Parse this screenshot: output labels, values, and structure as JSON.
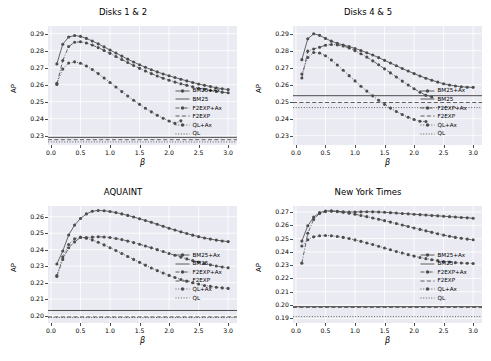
{
  "figure": {
    "width": 491,
    "height": 361,
    "background": "#ffffff",
    "panel_background": "#eaeaf2",
    "grid_color": "#ffffff",
    "series_color": "#4c4c4c",
    "text_color": "#000000"
  },
  "axis_labels": {
    "y": "AP",
    "x": "β"
  },
  "legend_entries": [
    {
      "label": "BM25+Ax",
      "style": "solid-marker"
    },
    {
      "label": "BM25",
      "style": "solid"
    },
    {
      "label": "F2EXP+Ax",
      "style": "dashdot-marker"
    },
    {
      "label": "F2EXP",
      "style": "dashed"
    },
    {
      "label": "QL+Ax",
      "style": "dotted-marker"
    },
    {
      "label": "QL",
      "style": "dotted"
    }
  ],
  "chart_data": [
    {
      "type": "line",
      "title": "Disks 1 & 2",
      "xlabel": "β",
      "ylabel": "AP",
      "xlim": [
        -0.05,
        3.15
      ],
      "ylim": [
        0.2245,
        0.2945
      ],
      "xticks": [
        "0.0",
        "0.5",
        "1.0",
        "1.5",
        "2.0",
        "2.5",
        "3.0"
      ],
      "xtick_values": [
        0.0,
        0.5,
        1.0,
        1.5,
        2.0,
        2.5,
        3.0
      ],
      "yticks": [
        "0.23",
        "0.24",
        "0.25",
        "0.26",
        "0.27",
        "0.28",
        "0.29"
      ],
      "ytick_values": [
        0.23,
        0.24,
        0.25,
        0.26,
        0.27,
        0.28,
        0.29
      ],
      "grid": true,
      "legend_position": "lower right",
      "x": [
        0.1,
        0.2,
        0.3,
        0.4,
        0.5,
        0.6,
        0.7,
        0.8,
        0.9,
        1.0,
        1.1,
        1.2,
        1.3,
        1.4,
        1.5,
        1.6,
        1.7,
        1.8,
        1.9,
        2.0,
        2.1,
        2.2,
        2.3,
        2.4,
        2.5,
        2.6,
        2.7,
        2.8,
        2.9,
        3.0
      ],
      "series": [
        {
          "name": "BM25+Ax",
          "values": [
            0.2722,
            0.2838,
            0.288,
            0.2889,
            0.2884,
            0.2872,
            0.2857,
            0.284,
            0.2822,
            0.2804,
            0.2786,
            0.2768,
            0.275,
            0.2733,
            0.2717,
            0.2702,
            0.2688,
            0.2675,
            0.2663,
            0.2652,
            0.2642,
            0.2632,
            0.2622,
            0.2613,
            0.2604,
            0.2596,
            0.2589,
            0.2582,
            0.2576,
            0.2571
          ]
        },
        {
          "name": "F2EXP+Ax",
          "values": [
            0.2601,
            0.2742,
            0.2824,
            0.2849,
            0.2852,
            0.2845,
            0.2833,
            0.2818,
            0.2801,
            0.2784,
            0.2766,
            0.2748,
            0.273,
            0.2713,
            0.2696,
            0.268,
            0.2665,
            0.2651,
            0.2638,
            0.2626,
            0.2615,
            0.2605,
            0.2596,
            0.2587,
            0.2579,
            0.2572,
            0.2566,
            0.256,
            0.2556,
            0.2552
          ]
        },
        {
          "name": "QL+Ax",
          "values": [
            0.2608,
            0.2692,
            0.2727,
            0.2734,
            0.2726,
            0.271,
            0.2689,
            0.2665,
            0.2639,
            0.2613,
            0.2586,
            0.2559,
            0.2533,
            0.2508,
            0.2484,
            0.2461,
            0.244,
            0.242,
            0.2402,
            0.2386,
            0.2372,
            0.2387,
            null,
            null,
            null,
            null,
            null,
            null,
            null,
            null
          ]
        }
      ],
      "hlines": [
        {
          "name": "BM25",
          "value": 0.229,
          "style": "solid"
        },
        {
          "name": "F2EXP",
          "value": 0.2276,
          "style": "dashed"
        },
        {
          "name": "QL",
          "value": 0.2263,
          "style": "dotted"
        }
      ]
    },
    {
      "type": "line",
      "title": "Disks 4 & 5",
      "xlabel": "β",
      "ylabel": "AP",
      "xlim": [
        -0.05,
        3.15
      ],
      "ylim": [
        0.2245,
        0.2945
      ],
      "xticks": [
        "0.0",
        "0.5",
        "1.0",
        "1.5",
        "2.0",
        "2.5",
        "3.0"
      ],
      "xtick_values": [
        0.0,
        0.5,
        1.0,
        1.5,
        2.0,
        2.5,
        3.0
      ],
      "yticks": [
        "0.23",
        "0.24",
        "0.25",
        "0.26",
        "0.27",
        "0.28",
        "0.29"
      ],
      "ytick_values": [
        0.23,
        0.24,
        0.25,
        0.26,
        0.27,
        0.28,
        0.29
      ],
      "grid": true,
      "legend_position": "lower right",
      "x": [
        0.1,
        0.2,
        0.3,
        0.4,
        0.5,
        0.6,
        0.7,
        0.8,
        0.9,
        1.0,
        1.1,
        1.2,
        1.3,
        1.4,
        1.5,
        1.6,
        1.7,
        1.8,
        1.9,
        2.0,
        2.1,
        2.2,
        2.3,
        2.4,
        2.5,
        2.6,
        2.7,
        2.8,
        2.9,
        3.0
      ],
      "series": [
        {
          "name": "BM25+Ax",
          "values": [
            0.2747,
            0.287,
            0.2899,
            0.289,
            0.2872,
            0.2856,
            0.2843,
            0.2833,
            0.2824,
            0.2813,
            0.2801,
            0.2788,
            0.2774,
            0.2759,
            0.2743,
            0.2727,
            0.2711,
            0.2695,
            0.268,
            0.2665,
            0.2651,
            0.2638,
            0.2626,
            0.2615,
            0.2605,
            0.2598,
            0.2592,
            0.2588,
            0.2585,
            0.2584
          ]
        },
        {
          "name": "F2EXP+Ax",
          "values": [
            0.2639,
            0.2797,
            0.281,
            0.282,
            0.2832,
            0.2836,
            0.2834,
            0.2827,
            0.2816,
            0.28,
            0.2782,
            0.2762,
            0.274,
            0.2717,
            0.2693,
            0.2669,
            0.2645,
            0.2621,
            0.2598,
            0.2576,
            0.2556,
            0.2537,
            0.2527,
            null,
            null,
            null,
            null,
            null,
            null,
            null
          ]
        },
        {
          "name": "QL+Ax",
          "values": [
            0.2663,
            0.276,
            0.2789,
            0.2786,
            0.277,
            0.2745,
            0.2716,
            0.2685,
            0.2653,
            0.2622,
            0.2591,
            0.2562,
            0.2534,
            0.2508,
            0.2484,
            0.2462,
            0.2442,
            0.2424,
            0.2408,
            0.2395,
            0.2385,
            0.2383,
            null,
            null,
            null,
            null,
            null,
            null,
            null,
            null
          ]
        }
      ],
      "hlines": [
        {
          "name": "BM25",
          "value": 0.2535,
          "style": "solid"
        },
        {
          "name": "F2EXP",
          "value": 0.2495,
          "style": "dashed"
        },
        {
          "name": "QL",
          "value": 0.2465,
          "style": "dotted"
        }
      ]
    },
    {
      "type": "line",
      "title": "AQUAINT",
      "xlabel": "β",
      "ylabel": "AP",
      "xlim": [
        -0.05,
        3.15
      ],
      "ylim": [
        0.1955,
        0.2665
      ],
      "xticks": [
        "0.0",
        "0.5",
        "1.0",
        "1.5",
        "2.0",
        "2.5",
        "3.0"
      ],
      "xtick_values": [
        0.0,
        0.5,
        1.0,
        1.5,
        2.0,
        2.5,
        3.0
      ],
      "yticks": [
        "0.20",
        "0.21",
        "0.22",
        "0.23",
        "0.24",
        "0.25",
        "0.26"
      ],
      "ytick_values": [
        0.2,
        0.21,
        0.22,
        0.23,
        0.24,
        0.25,
        0.26
      ],
      "grid": true,
      "legend_position": "center right",
      "x": [
        0.1,
        0.2,
        0.3,
        0.4,
        0.5,
        0.6,
        0.7,
        0.8,
        0.9,
        1.0,
        1.1,
        1.2,
        1.3,
        1.4,
        1.5,
        1.6,
        1.7,
        1.8,
        1.9,
        2.0,
        2.1,
        2.2,
        2.3,
        2.4,
        2.5,
        2.6,
        2.7,
        2.8,
        2.9,
        3.0
      ],
      "series": [
        {
          "name": "BM25+Ax",
          "values": [
            0.2313,
            0.2392,
            0.2489,
            0.2549,
            0.2589,
            0.2617,
            0.2633,
            0.2638,
            0.2636,
            0.2632,
            0.2625,
            0.2617,
            0.2608,
            0.2598,
            0.2588,
            0.2577,
            0.2566,
            0.2554,
            0.2542,
            0.253,
            0.2519,
            0.2508,
            0.2498,
            0.2488,
            0.2479,
            0.2471,
            0.2464,
            0.2458,
            0.2453,
            0.2449
          ]
        },
        {
          "name": "F2EXP+Ax",
          "values": [
            0.2237,
            0.2341,
            0.2412,
            0.2447,
            0.2474,
            0.2473,
            0.2476,
            0.2478,
            0.2477,
            0.2474,
            0.2468,
            0.2461,
            0.2452,
            0.2443,
            0.2433,
            0.2422,
            0.2411,
            0.24,
            0.2389,
            0.2377,
            0.2366,
            0.2355,
            0.2344,
            0.2334,
            0.2325,
            0.2316,
            0.2308,
            0.2301,
            0.2295,
            0.229
          ]
        },
        {
          "name": "QL+Ax",
          "values": [
            0.2243,
            0.2356,
            0.2431,
            0.2466,
            0.2476,
            0.247,
            0.2459,
            0.2445,
            0.2429,
            0.2412,
            0.2395,
            0.2377,
            0.2359,
            0.2341,
            0.2323,
            0.2306,
            0.2289,
            0.2273,
            0.2258,
            0.2244,
            0.2231,
            0.2219,
            0.2209,
            0.2199,
            0.2191,
            0.2183,
            0.2177,
            0.2172,
            0.2168,
            0.2165
          ]
        }
      ],
      "hlines": [
        {
          "name": "BM25",
          "value": 0.2031,
          "style": "solid"
        },
        {
          "name": "F2EXP",
          "value": 0.1992,
          "style": "dashed"
        },
        {
          "name": "QL",
          "value": 0.1988,
          "style": "dotted"
        }
      ]
    },
    {
      "type": "line",
      "title": "New York Times",
      "xlabel": "β",
      "ylabel": "AP",
      "xlim": [
        -0.05,
        3.15
      ],
      "ylim": [
        0.1865,
        0.2745
      ],
      "xticks": [
        "0.0",
        "0.5",
        "1.0",
        "1.5",
        "2.0",
        "2.5",
        "3.0"
      ],
      "xtick_values": [
        0.0,
        0.5,
        1.0,
        1.5,
        2.0,
        2.5,
        3.0
      ],
      "yticks": [
        "0.19",
        "0.20",
        "0.21",
        "0.22",
        "0.23",
        "0.24",
        "0.25",
        "0.26",
        "0.27"
      ],
      "ytick_values": [
        0.19,
        0.2,
        0.21,
        0.22,
        0.23,
        0.24,
        0.25,
        0.26,
        0.27
      ],
      "grid": true,
      "legend_position": "center right",
      "x": [
        0.1,
        0.2,
        0.3,
        0.4,
        0.5,
        0.6,
        0.7,
        0.8,
        0.9,
        1.0,
        1.1,
        1.2,
        1.3,
        1.4,
        1.5,
        1.6,
        1.7,
        1.8,
        1.9,
        2.0,
        2.1,
        2.2,
        2.3,
        2.4,
        2.5,
        2.6,
        2.7,
        2.8,
        2.9,
        3.0
      ],
      "series": [
        {
          "name": "BM25+Ax",
          "values": [
            0.2481,
            0.2596,
            0.2661,
            0.2695,
            0.2707,
            0.2709,
            0.2705,
            0.2701,
            0.27,
            0.27,
            0.2701,
            0.2702,
            0.2701,
            0.27,
            0.2698,
            0.2695,
            0.2692,
            0.2689,
            0.2686,
            0.2683,
            0.268,
            0.2677,
            0.2674,
            0.2671,
            0.2668,
            0.2665,
            0.2662,
            0.2659,
            0.2656,
            0.2653
          ]
        },
        {
          "name": "F2EXP+Ax",
          "values": [
            0.2315,
            0.254,
            0.2644,
            0.2689,
            0.2703,
            0.2705,
            0.2703,
            0.2698,
            0.2691,
            0.2683,
            0.2674,
            0.2665,
            0.2655,
            0.2645,
            0.2635,
            0.2624,
            0.2613,
            0.2602,
            0.2591,
            0.258,
            0.2569,
            0.2558,
            0.2547,
            0.2536,
            0.2526,
            0.2517,
            0.2509,
            0.2502,
            0.2496,
            0.2491
          ]
        },
        {
          "name": "QL+Ax",
          "values": [
            0.2444,
            0.2491,
            0.2513,
            0.2521,
            0.2523,
            0.2521,
            0.2516,
            0.2509,
            0.25,
            0.249,
            0.2479,
            0.2467,
            0.2455,
            0.2442,
            0.2429,
            0.2416,
            0.2403,
            0.2391,
            0.2379,
            0.2368,
            0.2358,
            0.2349,
            0.2341,
            0.2334,
            0.2328,
            0.2323,
            0.2319,
            0.2316,
            0.2314,
            0.2313
          ]
        }
      ],
      "hlines": [
        {
          "name": "BM25",
          "value": 0.1988,
          "style": "solid"
        },
        {
          "name": "F2EXP",
          "value": 0.1982,
          "style": "dashed"
        },
        {
          "name": "QL",
          "value": 0.1913,
          "style": "dotted"
        }
      ]
    }
  ]
}
